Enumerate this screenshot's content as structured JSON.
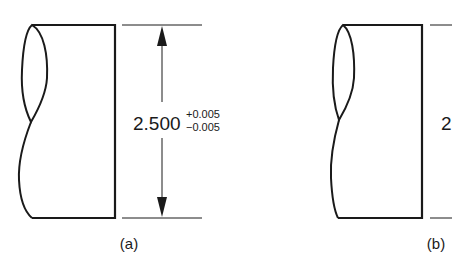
{
  "figure_a": {
    "label": "(a)",
    "dimension": {
      "nominal": "2.500",
      "tol_plus": "+0.005",
      "tol_minus": "−0.005"
    }
  },
  "figure_b": {
    "label": "(b)",
    "dimension": {
      "nominal_partial": "2"
    }
  },
  "colors": {
    "ink": "#1a1a1a",
    "background": "#ffffff"
  }
}
